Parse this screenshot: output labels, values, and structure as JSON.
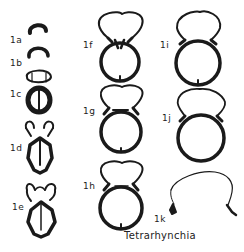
{
  "figure": {
    "caption": "Tetrarhynchia",
    "ink_color": "#1a1a1a",
    "sections": [
      {
        "id": "1a",
        "label": "1a",
        "x": 10,
        "y": 35
      },
      {
        "id": "1b",
        "label": "1b",
        "x": 10,
        "y": 62
      },
      {
        "id": "1c",
        "label": "1c",
        "x": 10,
        "y": 94
      },
      {
        "id": "1d",
        "label": "1d",
        "x": 10,
        "y": 147
      },
      {
        "id": "1e",
        "label": "1e",
        "x": 12,
        "y": 207
      },
      {
        "id": "1f",
        "label": "1f",
        "x": 83,
        "y": 44
      },
      {
        "id": "1g",
        "label": "1g",
        "x": 83,
        "y": 110
      },
      {
        "id": "1h",
        "label": "1h",
        "x": 83,
        "y": 185
      },
      {
        "id": "1i",
        "label": "1i",
        "x": 160,
        "y": 44
      },
      {
        "id": "1j",
        "label": "1j",
        "x": 162,
        "y": 118
      },
      {
        "id": "1k",
        "label": "1k",
        "x": 154,
        "y": 218
      }
    ]
  }
}
